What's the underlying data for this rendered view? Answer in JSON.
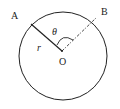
{
  "diagram": {
    "labels": {
      "A": "A",
      "B": "B",
      "theta": "θ",
      "r": "r",
      "O": "O"
    },
    "colors": {
      "stroke": "#222222",
      "background": "#ffffff"
    }
  }
}
